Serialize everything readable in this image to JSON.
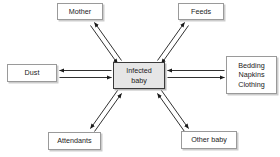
{
  "diagram": {
    "type": "hub-and-spoke",
    "center": {
      "id": "infected-baby",
      "lines": [
        "Infected",
        "baby"
      ],
      "fill": "#e6e6e6",
      "border": "#3a3a3a",
      "x": 113,
      "y": 62,
      "w": 52,
      "h": 27
    },
    "nodes": [
      {
        "id": "mother",
        "lines": [
          "Mother"
        ],
        "x": 57,
        "y": 3,
        "w": 46,
        "h": 17,
        "position": "top-left"
      },
      {
        "id": "feeds",
        "lines": [
          "Feeds"
        ],
        "x": 178,
        "y": 3,
        "w": 46,
        "h": 17,
        "position": "top-right"
      },
      {
        "id": "dust",
        "lines": [
          "Dust"
        ],
        "x": 7,
        "y": 64,
        "w": 50,
        "h": 18,
        "position": "left"
      },
      {
        "id": "bedding",
        "lines": [
          "Bedding",
          "Napkins",
          "Clothing"
        ],
        "x": 226,
        "y": 56,
        "w": 51,
        "h": 38,
        "position": "right"
      },
      {
        "id": "attendants",
        "lines": [
          "Attendants"
        ],
        "x": 48,
        "y": 132,
        "w": 53,
        "h": 18,
        "position": "bottom-left"
      },
      {
        "id": "other-baby",
        "lines": [
          "Other baby"
        ],
        "x": 181,
        "y": 131,
        "w": 56,
        "h": 18,
        "position": "bottom-right"
      }
    ],
    "connectors": [
      {
        "id": "mother-link",
        "from": "infected-baby",
        "to": "mother",
        "style": "bidirectional"
      },
      {
        "id": "feeds-link",
        "from": "infected-baby",
        "to": "feeds",
        "style": "bidirectional"
      },
      {
        "id": "dust-link",
        "from": "infected-baby",
        "to": "dust",
        "style": "bidirectional"
      },
      {
        "id": "bedding-link",
        "from": "infected-baby",
        "to": "bedding",
        "style": "bidirectional"
      },
      {
        "id": "attendants-link",
        "from": "infected-baby",
        "to": "attendants",
        "style": "bidirectional"
      },
      {
        "id": "other-baby-link",
        "from": "infected-baby",
        "to": "other-baby",
        "style": "bidirectional"
      }
    ],
    "colors": {
      "background": "#ffffff",
      "node_fill": "#ffffff",
      "node_border": "#9a9a9a",
      "center_fill": "#e6e6e6",
      "center_border": "#3a3a3a",
      "arrow": "#1a1a1a",
      "text": "#1a1a1a"
    }
  }
}
